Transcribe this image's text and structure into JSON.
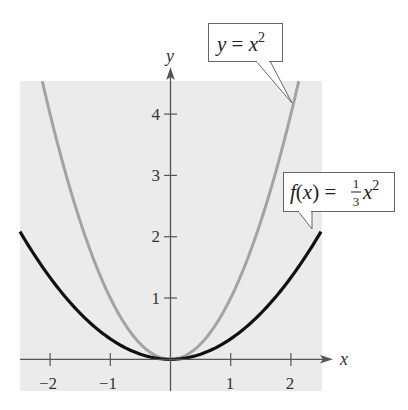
{
  "chart_data": {
    "type": "line",
    "title": "",
    "xlabel": "x",
    "ylabel": "y",
    "xlim": [
      -2.5,
      2.5
    ],
    "ylim": [
      -0.5,
      4.5
    ],
    "grid": false,
    "background_color": "#ebebeb",
    "x_ticks": [
      -2,
      -1,
      1,
      2
    ],
    "x_tick_labels": [
      "−2",
      "−1",
      "1",
      "2"
    ],
    "y_ticks": [
      1,
      2,
      3,
      4
    ],
    "y_tick_labels": [
      "1",
      "2",
      "3",
      "4"
    ],
    "series": [
      {
        "name": "y = x^2",
        "label_text": "y = x²",
        "formula": "x^2",
        "color": "#a3a3a3",
        "x": [
          -2.13,
          -2,
          -1.5,
          -1,
          -0.5,
          0,
          0.5,
          1,
          1.5,
          2,
          2.13
        ],
        "y": [
          4.53,
          4,
          2.25,
          1,
          0.25,
          0,
          0.25,
          1,
          2.25,
          4,
          4.53
        ]
      },
      {
        "name": "f(x) = (1/3)x^2",
        "label_text": "f(x) = ⅓x²",
        "formula": "x^2/3",
        "color": "#111111",
        "x": [
          -2.5,
          -2,
          -1.5,
          -1,
          -0.5,
          0,
          0.5,
          1,
          1.5,
          2,
          2.5
        ],
        "y": [
          2.08,
          1.33,
          0.75,
          0.33,
          0.08,
          0,
          0.08,
          0.33,
          0.75,
          1.33,
          2.08
        ]
      }
    ],
    "annotations": [
      {
        "text": "y = x²",
        "points_to": "gray curve near (2.1, 4.4)"
      },
      {
        "text": "f(x) = ⅓x²",
        "points_to": "black curve near (2.35, 2.1)"
      }
    ]
  },
  "labels": {
    "x_axis": "x",
    "y_axis": "y",
    "xticks": [
      "−2",
      "−1",
      "1",
      "2"
    ],
    "yticks": [
      "1",
      "2",
      "3",
      "4"
    ],
    "callout1": {
      "lhs": "y",
      "eq": " = ",
      "rhs": "x",
      "exp": "2"
    },
    "callout2": {
      "lhs": "f",
      "paren_open": "(",
      "arg": "x",
      "paren_close": ")",
      "eq": " = ",
      "num": "1",
      "den": "3",
      "rhs": "x",
      "exp": "2"
    }
  }
}
